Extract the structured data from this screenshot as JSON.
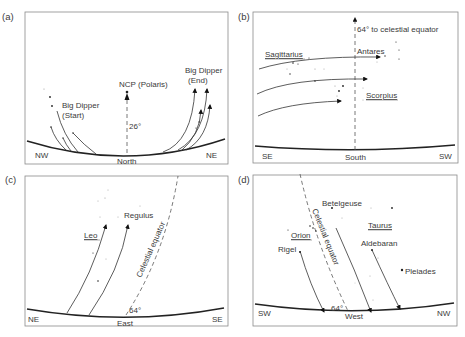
{
  "figure": {
    "panels": [
      {
        "id": "a",
        "label": "(a)",
        "direction_center": "North",
        "direction_left": "NW",
        "direction_right": "NE",
        "annotations": {
          "pole": "NCP (Polaris)",
          "angle": "26°",
          "start": "Big Dipper\n(Start)",
          "start_line1": "Big Dipper",
          "start_line2": "(Start)",
          "end_line1": "Big Dipper",
          "end_line2": "(End)"
        }
      },
      {
        "id": "b",
        "label": "(b)",
        "direction_center": "South",
        "direction_left": "SE",
        "direction_right": "SW",
        "annotations": {
          "equator_note": "64° to celestial equator",
          "constellation_1": "Sagittarius",
          "star_1": "Antares",
          "constellation_2": "Scorpius"
        }
      },
      {
        "id": "c",
        "label": "(c)",
        "direction_center": "East",
        "direction_left": "NE",
        "direction_right": "SE",
        "annotations": {
          "constellation": "Leo",
          "star": "Regulus",
          "equator": "Celestial equator",
          "angle": "64°"
        }
      },
      {
        "id": "d",
        "label": "(d)",
        "direction_center": "West",
        "direction_left": "SW",
        "direction_right": "NW",
        "annotations": {
          "star_1": "Betelgeuse",
          "constellation_1": "Orion",
          "star_2": "Rigel",
          "equator": "Celestial equator",
          "constellation_2": "Taurus",
          "star_3": "Aldebaran",
          "cluster": "Pleiades",
          "angle": "64°"
        }
      }
    ]
  }
}
